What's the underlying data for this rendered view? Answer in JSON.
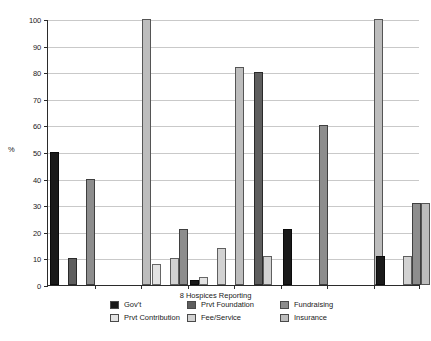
{
  "chart_data": {
    "type": "bar",
    "title": "",
    "subtitle": "",
    "xlabel": "8 Hospices Reporting",
    "ylabel": "%",
    "ylim": [
      0,
      100
    ],
    "ytick_labels": [
      "0",
      "10",
      "20",
      "30",
      "40",
      "50",
      "60",
      "70",
      "80",
      "90",
      "100"
    ],
    "yticks": [
      0,
      10,
      20,
      30,
      40,
      50,
      60,
      70,
      80,
      90,
      100
    ],
    "grid": "horizontal",
    "legend_position": "bottom",
    "categories": [
      "1",
      "2",
      "3",
      "4",
      "5",
      "6",
      "7",
      "8"
    ],
    "series": [
      {
        "name": "Gov't",
        "color": "#1a1a1a",
        "values": [
          50,
          0,
          0,
          2,
          0,
          21,
          0,
          11
        ]
      },
      {
        "name": "Prvt Contribution",
        "color": "#e3e3e3",
        "values": [
          0,
          0,
          8,
          3,
          0,
          0,
          0,
          0
        ]
      },
      {
        "name": "Prvt Foundation",
        "color": "#5e5e5e",
        "values": [
          10,
          0,
          0,
          0,
          80,
          0,
          0,
          0
        ]
      },
      {
        "name": "Fee/Service",
        "color": "#d2d2d2",
        "values": [
          0,
          0,
          10,
          14,
          11,
          0,
          0,
          11
        ]
      },
      {
        "name": "Fundraising",
        "color": "#8d8d8d",
        "values": [
          40,
          0,
          21,
          0,
          0,
          60,
          0,
          31
        ]
      },
      {
        "name": "Insurance",
        "color": "#bdbdbd",
        "values": [
          0,
          100,
          0,
          82,
          0,
          0,
          100,
          31
        ]
      }
    ]
  },
  "axis": {
    "y_title": "%",
    "x_title": "8 Hospices Reporting"
  },
  "legend": {
    "columns": [
      {
        "items": [
          {
            "label": "Gov't",
            "color": "#1a1a1a",
            "swatch_name": "legend-swatch-govt"
          },
          {
            "label": "Prvt Contribution",
            "color": "#e3e3e3",
            "swatch_name": "legend-swatch-prvt-contribution"
          }
        ]
      },
      {
        "items": [
          {
            "label": "Prvt Foundation",
            "color": "#5e5e5e",
            "swatch_name": "legend-swatch-prvt-foundation"
          },
          {
            "label": "Fee/Service",
            "color": "#d2d2d2",
            "swatch_name": "legend-swatch-fee-service"
          }
        ]
      },
      {
        "items": [
          {
            "label": "Fundraising",
            "color": "#8d8d8d",
            "swatch_name": "legend-swatch-fundraising"
          },
          {
            "label": "Insurance",
            "color": "#bdbdbd",
            "swatch_name": "legend-swatch-insurance"
          }
        ]
      }
    ]
  }
}
